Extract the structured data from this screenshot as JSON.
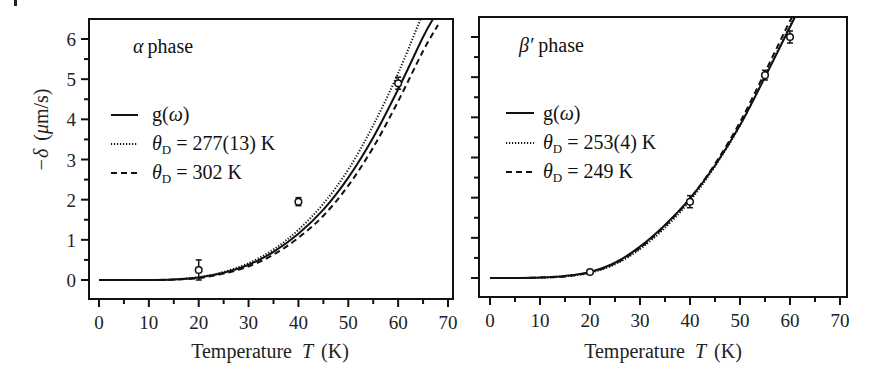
{
  "figure": {
    "corner_mark": "|"
  },
  "chart_data": [
    {
      "type": "line",
      "panel": "left",
      "title": "α phase",
      "title_symbol": "α",
      "title_text": "phase",
      "xlabel": "Temperature T (K)",
      "xlabel_parts": {
        "prefix": "Temperature",
        "var": "T",
        "unit": "(K)"
      },
      "ylabel": "−δ (μm/s)",
      "ylabel_parts": {
        "sym": "−δ",
        "unit": "(μm/s)",
        "mu": "μ",
        "rest": "m/s)",
        "open": "("
      },
      "xlim": [
        -1,
        71
      ],
      "ylim": [
        -0.5,
        6.5
      ],
      "xticks": [
        0,
        10,
        20,
        30,
        40,
        50,
        60,
        70
      ],
      "xtick_labels": [
        "0",
        "10",
        "20",
        "30",
        "40",
        "50",
        "60",
        "70"
      ],
      "yticks": [
        0,
        1,
        2,
        3,
        4,
        5,
        6
      ],
      "ytick_labels": [
        "0",
        "1",
        "2",
        "3",
        "4",
        "5",
        "6"
      ],
      "grid": false,
      "legend_position": "middle-left",
      "series": [
        {
          "name": "g(ω)",
          "style": "solid",
          "x": [
            0,
            5,
            10,
            15,
            20,
            25,
            30,
            35,
            40,
            45,
            50,
            55,
            60,
            65,
            67
          ],
          "y": [
            0.0,
            0.0,
            0.0,
            0.01,
            0.06,
            0.18,
            0.38,
            0.7,
            1.15,
            1.75,
            2.55,
            3.55,
            4.75,
            6.05,
            6.5
          ]
        },
        {
          "name": "θD = 277(13) K",
          "style": "dotted",
          "x": [
            0,
            5,
            10,
            15,
            20,
            25,
            30,
            35,
            40,
            45,
            50,
            55,
            60,
            64.5
          ],
          "y": [
            0.0,
            0.0,
            0.0,
            0.01,
            0.07,
            0.2,
            0.42,
            0.76,
            1.25,
            1.9,
            2.75,
            3.85,
            5.15,
            6.5
          ]
        },
        {
          "name": "θD = 302 K",
          "style": "dashed",
          "x": [
            0,
            5,
            10,
            15,
            20,
            25,
            30,
            35,
            40,
            45,
            50,
            55,
            60,
            65,
            68
          ],
          "y": [
            0.0,
            0.0,
            0.0,
            0.01,
            0.05,
            0.16,
            0.34,
            0.63,
            1.05,
            1.6,
            2.35,
            3.3,
            4.45,
            5.7,
            6.35
          ]
        }
      ],
      "legend": [
        {
          "style": "solid",
          "label": "g(ω)",
          "label_parts": {
            "pre": "g(",
            "sym": "ω",
            "post": ")"
          }
        },
        {
          "style": "dotted",
          "label": "θD = 277(13) K",
          "label_parts": {
            "sym": "θ",
            "sub": "D",
            "post": " = 277(13) K"
          }
        },
        {
          "style": "dashed",
          "label": "θD = 302 K",
          "label_parts": {
            "sym": "θ",
            "sub": "D",
            "post": " = 302 K"
          }
        }
      ],
      "points": {
        "x": [
          20,
          40,
          60
        ],
        "y": [
          0.25,
          1.95,
          4.9
        ],
        "yerr": [
          0.25,
          0.1,
          0.15
        ]
      }
    },
    {
      "type": "line",
      "panel": "right",
      "title": "β′ phase",
      "title_symbol": "β′",
      "title_text": "phase",
      "xlabel": "Temperature T (K)",
      "xlabel_parts": {
        "prefix": "Temperature",
        "var": "T",
        "unit": "(K)"
      },
      "ylabel": "",
      "xlim": [
        -1,
        71
      ],
      "ylim": [
        -0.5,
        6.5
      ],
      "xticks": [
        0,
        10,
        20,
        30,
        40,
        50,
        60,
        70
      ],
      "xtick_labels": [
        "0",
        "10",
        "20",
        "30",
        "40",
        "50",
        "60",
        "70"
      ],
      "yticks": [
        0,
        1,
        2,
        3,
        4,
        5,
        6
      ],
      "ytick_labels": [],
      "grid": false,
      "legend_position": "middle-left",
      "series": [
        {
          "name": "g(ω)",
          "style": "solid",
          "x": [
            0,
            5,
            10,
            15,
            20,
            25,
            30,
            35,
            40,
            45,
            50,
            55,
            60,
            61
          ],
          "y": [
            0.0,
            0.0,
            0.01,
            0.05,
            0.15,
            0.38,
            0.78,
            1.32,
            1.98,
            2.8,
            3.8,
            5.0,
            6.25,
            6.5
          ]
        },
        {
          "name": "θD = 253(4) K",
          "style": "dotted",
          "x": [
            0,
            5,
            10,
            15,
            20,
            25,
            30,
            35,
            40,
            45,
            50,
            55,
            60,
            61
          ],
          "y": [
            0.0,
            0.0,
            0.01,
            0.04,
            0.13,
            0.34,
            0.72,
            1.25,
            1.92,
            2.78,
            3.8,
            5.02,
            6.28,
            6.5
          ]
        },
        {
          "name": "θD = 249 K",
          "style": "dashed",
          "x": [
            0,
            5,
            10,
            15,
            20,
            25,
            30,
            35,
            40,
            45,
            50,
            55,
            60,
            60.8
          ],
          "y": [
            0.0,
            0.0,
            0.01,
            0.04,
            0.14,
            0.36,
            0.75,
            1.3,
            1.97,
            2.84,
            3.88,
            5.12,
            6.4,
            6.5
          ]
        }
      ],
      "legend": [
        {
          "style": "solid",
          "label": "g(ω)",
          "label_parts": {
            "pre": "g(",
            "sym": "ω",
            "post": ")"
          }
        },
        {
          "style": "dotted",
          "label": "θD = 253(4) K",
          "label_parts": {
            "sym": "θ",
            "sub": "D",
            "post": " = 253(4) K"
          }
        },
        {
          "style": "dashed",
          "label": "θD = 249 K",
          "label_parts": {
            "sym": "θ",
            "sub": "D",
            "post": " = 249 K"
          }
        }
      ],
      "points": {
        "x": [
          20,
          40,
          55,
          60
        ],
        "y": [
          0.15,
          1.9,
          5.05,
          6.0
        ],
        "yerr": [
          0.05,
          0.15,
          0.12,
          0.15
        ]
      }
    }
  ]
}
